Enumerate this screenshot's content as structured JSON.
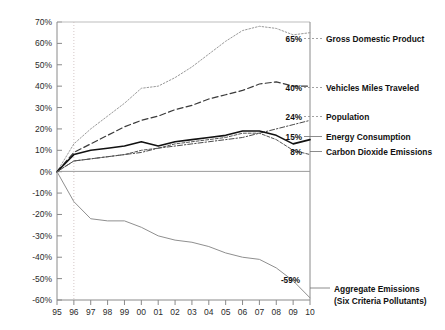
{
  "chart_data": {
    "type": "line",
    "title": "",
    "xlabel": "",
    "ylabel": "",
    "x": [
      1995,
      1996,
      1997,
      1998,
      1999,
      2000,
      2001,
      2002,
      2003,
      2004,
      2005,
      2006,
      2007,
      2008,
      2009,
      2010
    ],
    "x_tick_labels": [
      "95",
      "96",
      "97",
      "98",
      "99",
      "00",
      "01",
      "02",
      "03",
      "04",
      "05",
      "06",
      "07",
      "08",
      "09",
      "10"
    ],
    "y_tick_labels": [
      "70%",
      "60%",
      "50%",
      "40%",
      "30%",
      "20%",
      "10%",
      "0%",
      "-10%",
      "-20%",
      "-30%",
      "-40%",
      "-50%",
      "-60%"
    ],
    "y_ticks": [
      70,
      60,
      50,
      40,
      30,
      20,
      10,
      0,
      -10,
      -20,
      -30,
      -40,
      -50,
      -60
    ],
    "ylim": [
      -60,
      70
    ],
    "xlim": [
      1995,
      2010
    ],
    "grid": "vertical-dotted-at-1996",
    "legend_position": "right-inline-labels",
    "series": [
      {
        "name": "Gross Domestic Product",
        "label": "Gross Domestic Product",
        "end_value_label": "65%",
        "style": "dotted",
        "color": "#9a9a9a",
        "width": 1.0,
        "values": [
          0,
          13,
          20,
          26,
          32,
          39,
          40,
          44,
          49,
          55,
          61,
          66,
          68,
          67,
          64,
          65
        ]
      },
      {
        "name": "Vehicles Miles Traveled",
        "label": "Vehicles Miles Traveled",
        "end_value_label": "40%",
        "style": "dashed",
        "color": "#3a3a3a",
        "width": 1.2,
        "values": [
          0,
          9,
          13,
          17,
          21,
          24,
          26,
          29,
          31,
          34,
          36,
          38,
          41,
          42,
          40,
          40
        ]
      },
      {
        "name": "Population",
        "label": "Population",
        "end_value_label": "24%",
        "style": "dash-dot",
        "color": "#4a4a4a",
        "width": 1.0,
        "values": [
          0,
          5,
          6,
          7,
          8,
          9,
          11,
          12,
          13,
          14,
          15,
          16,
          18,
          20,
          22,
          24
        ]
      },
      {
        "name": "Energy Consumption",
        "label": "Energy Consumption",
        "end_value_label": "15%",
        "style": "solid",
        "color": "#111111",
        "width": 1.6,
        "values": [
          0,
          8,
          10,
          11,
          12,
          14,
          12,
          14,
          15,
          16,
          17,
          19,
          19,
          17,
          13,
          15
        ]
      },
      {
        "name": "Carbon Dioxide Emissions",
        "label": "Carbon Dioxide Emissions",
        "end_value_label": "8%",
        "style": "fine-dashed",
        "color": "#555555",
        "width": 1.0,
        "values": [
          0,
          5,
          6,
          7,
          8,
          10,
          11,
          13,
          14,
          15,
          16,
          18,
          18,
          15,
          10,
          8
        ]
      },
      {
        "name": "Aggregate Emissions (Six Criteria Pollutants)",
        "label": "Aggregate Emissions",
        "label_line2": "(Six Criteria Pollutants)",
        "end_value_label": "-59%",
        "style": "solid-thin",
        "color": "#8f8f8f",
        "width": 1.0,
        "values": [
          0,
          -14,
          -22,
          -23,
          -23,
          -26,
          -30,
          -32,
          -33,
          -35,
          -38,
          -40,
          -41,
          -45,
          -51,
          -59
        ]
      }
    ]
  },
  "labels": {
    "gdp": "Gross Domestic Product",
    "vmt": "Vehicles Miles Traveled",
    "population": "Population",
    "energy": "Energy Consumption",
    "co2": "Carbon Dioxide Emissions",
    "aggregate_line1": "Aggregate Emissions",
    "aggregate_line2": "(Six Criteria Pollutants)"
  },
  "values": {
    "gdp": "65%",
    "vmt": "40%",
    "population": "24%",
    "energy": "15%",
    "co2": "8%",
    "aggregate": "-59%"
  }
}
